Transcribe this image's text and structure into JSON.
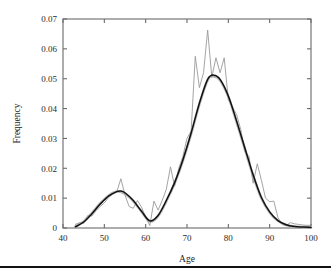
{
  "figure": {
    "background_color": "#ffffff",
    "frame_color": "#6b6b6b",
    "page_rule_color": "#111111"
  },
  "chart_data": {
    "type": "line",
    "title": "",
    "xlabel": "Age",
    "ylabel": "Frequency",
    "xlim": [
      40,
      100
    ],
    "ylim": [
      0,
      0.07
    ],
    "xticks": [
      40,
      50,
      60,
      70,
      80,
      90,
      100
    ],
    "yticks": [
      0,
      0.01,
      0.02,
      0.03,
      0.04,
      0.05,
      0.06,
      0.07
    ],
    "xtick_labels": [
      "40",
      "50",
      "60",
      "70",
      "80",
      "90",
      "100"
    ],
    "ytick_labels": [
      "0",
      "0.01",
      "0.02",
      "0.03",
      "0.04",
      "0.05",
      "0.06",
      "0.07"
    ],
    "grid": false,
    "legend": false,
    "legend_position": "none",
    "tick_direction": "in",
    "annotations": [
      "bimodal distribution",
      "minor mode near age 53",
      "dominant mode near age 76"
    ],
    "series": [
      {
        "name": "empirical-histogram",
        "style": "thin jagged line",
        "color": "#9a9a9a",
        "x": [
          43,
          44,
          45,
          46,
          47,
          48,
          49,
          50,
          51,
          52,
          53,
          54,
          55,
          56,
          57,
          58,
          59,
          60,
          61,
          62,
          63,
          64,
          65,
          66,
          67,
          68,
          69,
          70,
          71,
          72,
          73,
          74,
          75,
          76,
          77,
          78,
          79,
          80,
          81,
          82,
          83,
          84,
          85,
          86,
          87,
          88,
          89,
          90,
          91,
          92,
          93,
          94,
          95,
          96,
          97,
          98,
          99,
          100
        ],
        "values": [
          0.0012,
          0.0018,
          0.0015,
          0.0042,
          0.004,
          0.0058,
          0.0072,
          0.0084,
          0.0102,
          0.0113,
          0.012,
          0.0165,
          0.011,
          0.0072,
          0.0066,
          0.0092,
          0.007,
          0.0037,
          0.0008,
          0.009,
          0.006,
          0.0092,
          0.013,
          0.0205,
          0.014,
          0.02,
          0.024,
          0.03,
          0.0325,
          0.0575,
          0.047,
          0.052,
          0.0663,
          0.0505,
          0.057,
          0.052,
          0.057,
          0.043,
          0.0405,
          0.038,
          0.033,
          0.0255,
          0.024,
          0.015,
          0.0215,
          0.016,
          0.01,
          0.0088,
          0.009,
          0.0035,
          0.0012,
          0.0008,
          0.0018,
          0.0014,
          0.0012,
          0.001,
          0.0009,
          0.0009
        ]
      },
      {
        "name": "smoothed-gray",
        "style": "thick light gray smooth curve",
        "color": "#b9b9b9",
        "x": [
          43,
          45,
          47,
          49,
          51,
          53,
          55,
          57,
          59,
          61,
          63,
          65,
          67,
          69,
          71,
          73,
          75,
          76.5,
          78,
          80,
          82,
          84,
          86,
          88,
          90,
          92,
          94,
          96,
          98,
          100
        ],
        "values": [
          0.0005,
          0.0022,
          0.005,
          0.0082,
          0.0108,
          0.0122,
          0.0114,
          0.009,
          0.0055,
          0.0022,
          0.004,
          0.009,
          0.015,
          0.0225,
          0.0315,
          0.0415,
          0.0495,
          0.0508,
          0.0495,
          0.044,
          0.0355,
          0.0265,
          0.0175,
          0.01,
          0.0052,
          0.0024,
          0.001,
          0.0005,
          0.0003,
          0.0002
        ]
      },
      {
        "name": "fitted-mixture",
        "style": "black smooth curve",
        "color": "#111111",
        "x": [
          43,
          45,
          47,
          49,
          51,
          53,
          54,
          55,
          57,
          59,
          61,
          63,
          65,
          67,
          69,
          71,
          73,
          75,
          76.5,
          78,
          80,
          82,
          84,
          86,
          88,
          90,
          92,
          94,
          96,
          98,
          100
        ],
        "values": [
          0.0004,
          0.002,
          0.0048,
          0.008,
          0.0107,
          0.0122,
          0.0124,
          0.0118,
          0.0092,
          0.0056,
          0.0024,
          0.0042,
          0.0092,
          0.0152,
          0.0228,
          0.0318,
          0.0418,
          0.0498,
          0.0512,
          0.0498,
          0.0442,
          0.0358,
          0.0268,
          0.0178,
          0.0102,
          0.0054,
          0.0025,
          0.0011,
          0.0005,
          0.0003,
          0.0002
        ]
      }
    ]
  }
}
